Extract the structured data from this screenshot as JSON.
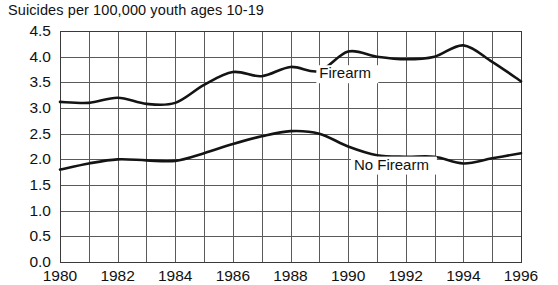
{
  "chart_data": {
    "type": "line",
    "title": "Suicides per 100,000 youth ages 10-19",
    "xlabel": "",
    "ylabel": "",
    "xlim": [
      1980,
      1996
    ],
    "ylim": [
      0.0,
      4.5
    ],
    "grid": true,
    "legend_position": "inline-annotation",
    "x": [
      1980,
      1981,
      1982,
      1983,
      1984,
      1985,
      1986,
      1987,
      1988,
      1989,
      1990,
      1991,
      1992,
      1993,
      1994,
      1995,
      1996
    ],
    "y_ticks": [
      "0.0",
      "0.5",
      "1.0",
      "1.5",
      "2.0",
      "2.5",
      "3.0",
      "3.5",
      "4.0",
      "4.5"
    ],
    "y_tick_values": [
      0.0,
      0.5,
      1.0,
      1.5,
      2.0,
      2.5,
      3.0,
      3.5,
      4.0,
      4.5
    ],
    "x_ticks": [
      "1980",
      "1982",
      "1984",
      "1986",
      "1988",
      "1990",
      "1992",
      "1994",
      "1996"
    ],
    "x_tick_values": [
      1980,
      1982,
      1984,
      1986,
      1988,
      1990,
      1992,
      1994,
      1996
    ],
    "x_minor_every": 1,
    "series": [
      {
        "name": "Firearm",
        "label_x": 1989.0,
        "label_y": 3.58,
        "values": [
          3.12,
          3.1,
          3.2,
          3.08,
          3.1,
          3.45,
          3.7,
          3.62,
          3.8,
          3.72,
          4.1,
          4.0,
          3.95,
          4.0,
          4.22,
          3.9,
          3.52
        ]
      },
      {
        "name": "No Firearm",
        "label_x": 1990.2,
        "label_y": 1.8,
        "values": [
          1.8,
          1.92,
          2.0,
          1.98,
          1.97,
          2.12,
          2.3,
          2.45,
          2.55,
          2.5,
          2.25,
          2.08,
          2.05,
          2.05,
          1.92,
          2.02,
          2.12
        ]
      }
    ]
  },
  "layout": {
    "plot_left": 60,
    "plot_right": 521,
    "plot_top": 31,
    "plot_bottom": 262
  }
}
